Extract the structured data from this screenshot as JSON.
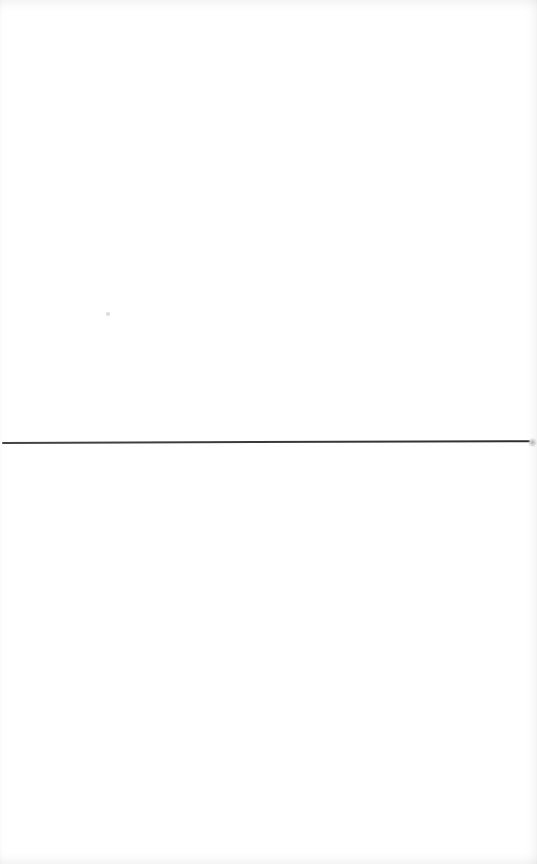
{
  "page": {
    "background_color": "#ffffff",
    "divider": {
      "orientation": "horizontal",
      "color": "#3a3a3a"
    }
  }
}
